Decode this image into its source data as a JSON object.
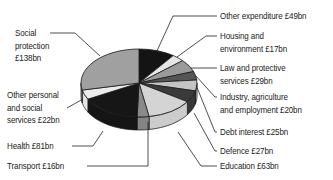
{
  "chart_data": {
    "type": "pie",
    "style": "3d-pie",
    "title": "",
    "unit": "£bn",
    "start_angle": "12 o'clock",
    "direction": "clockwise",
    "slices": [
      {
        "label": "Other expenditure",
        "value": 49,
        "display": "Other expenditure £49bn",
        "color": "#141414"
      },
      {
        "label": "Housing and environment",
        "value": 17,
        "display": "Housing and environment £17bn",
        "color": "#e6e6e6"
      },
      {
        "label": "Law and protective services",
        "value": 29,
        "display": "Law and protective services £29bn",
        "color": "#9a9a9a"
      },
      {
        "label": "Industry, agriculture and employment",
        "value": 20,
        "display": "Industry, agriculture and employment £20bn",
        "color": "#555555"
      },
      {
        "label": "Debt interest",
        "value": 25,
        "display": "Debt interest £25bn",
        "color": "#c4c4c4"
      },
      {
        "label": "Defence",
        "value": 27,
        "display": "Defence £27bn",
        "color": "#3a3a3a"
      },
      {
        "label": "Education",
        "value": 63,
        "display": "Education £63bn",
        "color": "#d4d4d4"
      },
      {
        "label": "Transport",
        "value": 16,
        "display": "Transport £16bn",
        "color": "#8a8a8a"
      },
      {
        "label": "Health",
        "value": 81,
        "display": "Health £81bn",
        "color": "#161616"
      },
      {
        "label": "Other personal and social services",
        "value": 22,
        "display": "Other personal and social services £22bn",
        "color": "#ececec"
      },
      {
        "label": "Social protection",
        "value": 138,
        "display": "Social protection £138bn",
        "color": "#a0a0a0"
      }
    ],
    "legend_position": "callout labels around pie"
  },
  "labels": {
    "other_expenditure": [
      "Other expenditure £49bn"
    ],
    "housing": [
      "Housing and",
      "environment £17bn"
    ],
    "law": [
      "Law and protective",
      "services £29bn"
    ],
    "industry": [
      "Industry, agriculture",
      "and employment £20bn"
    ],
    "debt": [
      "Debt interest £25bn"
    ],
    "defence": [
      "Defence £27bn"
    ],
    "education": [
      "Education £63bn"
    ],
    "transport": [
      "Transport £16bn"
    ],
    "health": [
      "Health £81bn"
    ],
    "other_personal": [
      "Other personal",
      "and social",
      "services £22bn"
    ],
    "social": [
      "Social",
      "protection",
      "£138bn"
    ]
  }
}
